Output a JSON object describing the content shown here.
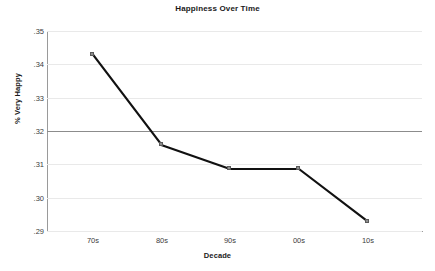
{
  "chart_data": {
    "type": "line",
    "title": "Happiness Over Time",
    "xlabel": "Decade",
    "ylabel": "% Very Happy",
    "categories": [
      "70s",
      "80s",
      "90s",
      "00s",
      "10s"
    ],
    "values": [
      0.3429,
      0.3157,
      0.3086,
      0.3086,
      0.2928
    ],
    "ylim": [
      0.29,
      0.35
    ],
    "yticks": [
      ".35",
      ".34",
      ".33",
      ".32",
      ".31",
      ".30",
      ".29"
    ],
    "ytick_values": [
      0.35,
      0.34,
      0.33,
      0.32,
      0.31,
      0.3,
      0.29
    ],
    "grid": true,
    "legend": "none",
    "reference_line": 0.32,
    "series": [
      {
        "name": "% Very Happy",
        "values": [
          0.3429,
          0.3157,
          0.3086,
          0.3086,
          0.2928
        ],
        "line_color": "#111111",
        "marker_color": "#8d8d8d",
        "marker_shape": "square"
      }
    ],
    "colors": {
      "line": "#111111",
      "marker": "#8d8d8d",
      "grid": "#e9e9e9",
      "reference_line": "#8c8c8c",
      "axis": "#9a9a9a",
      "text": "#1a1a1a",
      "background": "#ffffff"
    }
  }
}
